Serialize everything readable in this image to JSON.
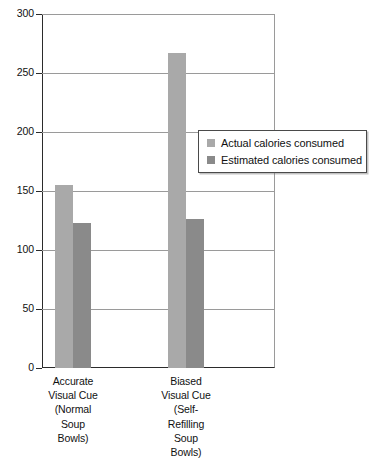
{
  "chart_data": {
    "type": "bar",
    "title": "",
    "subtitle": "",
    "xlabel": "",
    "ylabel": "",
    "ylim": [
      0,
      300
    ],
    "yticks": [
      0,
      50,
      100,
      150,
      200,
      250,
      300
    ],
    "ytick_labels": [
      "0",
      "50",
      "100",
      "150",
      "200",
      "250",
      "300"
    ],
    "grid": true,
    "legend_position": "right-middle",
    "categories": [
      "Accurate Visual Cue (Normal Soup Bowls)",
      "Biased Visual Cue (Self-Refilling Soup Bowls)"
    ],
    "category_lines": [
      [
        "Accurate",
        "Visual Cue",
        "(Normal",
        "Soup",
        "Bowls)"
      ],
      [
        "Biased",
        "Visual Cue",
        "(Self-",
        "Refilling",
        "Soup",
        "Bowls)"
      ]
    ],
    "series": [
      {
        "name": "Actual calories consumed",
        "color": "#a9a9a9",
        "values": [
          155,
          267
        ]
      },
      {
        "name": "Estimated calories consumed",
        "color": "#8a8a8a",
        "values": [
          123,
          126
        ]
      }
    ]
  },
  "legend": {
    "items": [
      {
        "label": "Actual calories consumed",
        "color": "#a9a9a9"
      },
      {
        "label": "Estimated calories consumed",
        "color": "#8a8a8a"
      }
    ]
  },
  "axis": {
    "y": {
      "labels": [
        "300",
        "250",
        "200",
        "150",
        "100",
        "50",
        "0"
      ]
    }
  }
}
